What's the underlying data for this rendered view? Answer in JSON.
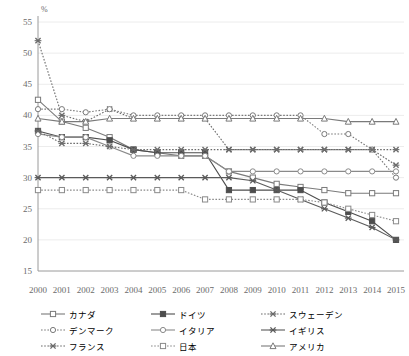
{
  "chart_data": {
    "type": "line",
    "title": "",
    "xlabel": "",
    "ylabel": "%",
    "ylim": [
      15,
      55
    ],
    "ytick_step": 5,
    "yticks": [
      15,
      20,
      25,
      30,
      35,
      40,
      45,
      50,
      55
    ],
    "grid": true,
    "grid_axis": "y",
    "legend_position": "bottom",
    "legend_columns": 3,
    "categories": [
      2000,
      2001,
      2002,
      2003,
      2004,
      2005,
      2006,
      2007,
      2008,
      2009,
      2010,
      2011,
      2012,
      2013,
      2014,
      2015
    ],
    "series": [
      {
        "name": "カナダ",
        "marker": "square-open",
        "line": "solid",
        "color": "#7a7a7a",
        "values": [
          42.5,
          39.0,
          38.0,
          36.5,
          34.5,
          34.0,
          33.5,
          33.5,
          31.0,
          30.0,
          29.0,
          28.5,
          28.0,
          27.5,
          27.5,
          27.5
        ]
      },
      {
        "name": "ドイツ",
        "marker": "square-filled",
        "line": "solid",
        "color": "#4d4d4d",
        "values": [
          37.5,
          36.5,
          36.5,
          36.0,
          34.5,
          34.0,
          34.0,
          34.0,
          28.0,
          28.0,
          28.0,
          28.0,
          26.0,
          24.5,
          23.0,
          20.0
        ]
      },
      {
        "name": "スウェーデン",
        "marker": "x-cross",
        "line": "dotted",
        "color": "#6b6b6b",
        "values": [
          52.0,
          40.0,
          39.0,
          41.0,
          39.5,
          39.5,
          39.5,
          39.5,
          34.5,
          34.5,
          34.5,
          34.5,
          34.5,
          34.5,
          34.5,
          32.0
        ]
      },
      {
        "name": "デンマーク",
        "marker": "circle-open",
        "line": "dotted",
        "color": "#7a7a7a",
        "values": [
          41.0,
          41.0,
          40.5,
          41.0,
          40.0,
          40.0,
          40.0,
          40.0,
          40.0,
          40.0,
          40.0,
          40.0,
          37.0,
          37.0,
          34.5,
          30.0
        ]
      },
      {
        "name": "イタリア",
        "marker": "circle-open",
        "line": "solid",
        "color": "#8a8a8a",
        "values": [
          37.0,
          36.5,
          36.5,
          35.0,
          33.5,
          33.5,
          33.5,
          33.5,
          31.0,
          31.0,
          31.0,
          31.0,
          31.0,
          31.0,
          31.0,
          31.0
        ]
      },
      {
        "name": "イギリス",
        "marker": "x-cross",
        "line": "solid",
        "color": "#5a5a5a",
        "values": [
          30.0,
          30.0,
          30.0,
          30.0,
          30.0,
          30.0,
          30.0,
          30.0,
          30.0,
          29.5,
          28.0,
          26.5,
          25.0,
          23.5,
          22.0,
          20.0
        ]
      },
      {
        "name": "フランス",
        "marker": "x-cross",
        "line": "dotted",
        "color": "#6b6b6b",
        "values": [
          37.5,
          35.5,
          35.5,
          35.0,
          34.5,
          34.5,
          34.5,
          34.5,
          34.5,
          34.5,
          34.5,
          34.5,
          34.5,
          34.5,
          34.5,
          34.5
        ]
      },
      {
        "name": "日本",
        "marker": "square-open",
        "line": "dotted",
        "color": "#8a8a8a",
        "values": [
          28.0,
          28.0,
          28.0,
          28.0,
          28.0,
          28.0,
          28.0,
          26.5,
          26.5,
          26.5,
          26.5,
          26.5,
          26.0,
          25.0,
          24.0,
          23.0
        ]
      },
      {
        "name": "アメリカ",
        "marker": "triangle-open",
        "line": "solid",
        "color": "#7a7a7a",
        "values": [
          39.5,
          39.0,
          39.0,
          39.5,
          39.5,
          39.5,
          39.5,
          39.5,
          39.5,
          39.5,
          39.5,
          39.5,
          39.5,
          39.0,
          39.0,
          39.0
        ]
      }
    ]
  },
  "axis": {
    "y_unit_label": "%",
    "x_tick_labels": [
      "2000",
      "2001",
      "2002",
      "2003",
      "2004",
      "2005",
      "2006",
      "2007",
      "2008",
      "2009",
      "2010",
      "2011",
      "2012",
      "2013",
      "2014",
      "2015"
    ],
    "y_tick_labels": [
      "55",
      "50",
      "45",
      "40",
      "35",
      "30",
      "25",
      "20",
      "15"
    ]
  },
  "legend": {
    "items": [
      {
        "label": "カナダ"
      },
      {
        "label": "ドイツ"
      },
      {
        "label": "スウェーデン"
      },
      {
        "label": "デンマーク"
      },
      {
        "label": "イタリア"
      },
      {
        "label": "イギリス"
      },
      {
        "label": "フランス"
      },
      {
        "label": "日本"
      },
      {
        "label": "アメリカ"
      }
    ],
    "order": [
      0,
      1,
      2,
      3,
      4,
      5,
      6,
      7,
      8
    ]
  },
  "colors": {
    "axis": "#9a9a9a",
    "grid": "#ececec",
    "text": "#6b6b6b",
    "background": "#ffffff"
  }
}
